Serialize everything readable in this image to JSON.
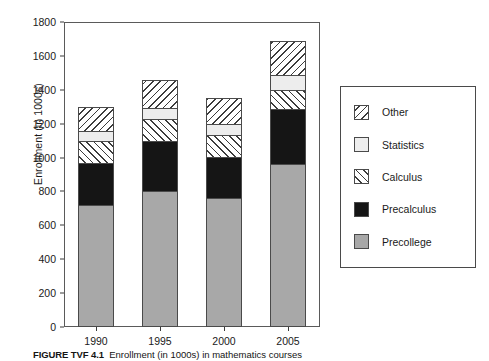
{
  "chart_data": {
    "type": "bar",
    "subtype": "stacked-bar",
    "title": "",
    "xlabel": "",
    "ylabel": "Enrollment (in 1000s)",
    "categories": [
      "1990",
      "1995",
      "2000",
      "2005"
    ],
    "ylim": [
      0,
      1800
    ],
    "yticks": [
      0,
      200,
      400,
      600,
      800,
      1000,
      1200,
      1400,
      1600,
      1800
    ],
    "ytick_labels": [
      "0",
      "200",
      "400",
      "600",
      "800",
      "1000",
      "1200",
      "1400",
      "1600",
      "1800"
    ],
    "grid": false,
    "legend_position": "right-outside",
    "stack_order_bottom_to_top": [
      "Precollege",
      "Precalculus",
      "Calculus",
      "Statistics",
      "Other"
    ],
    "series": [
      {
        "name": "Precollege",
        "fill": "solid-gray",
        "color": "#a8a8a8",
        "values": [
          720,
          800,
          760,
          960
        ]
      },
      {
        "name": "Precalculus",
        "fill": "solid-black",
        "color": "#151515",
        "values": [
          250,
          295,
          245,
          325
        ]
      },
      {
        "name": "Calculus",
        "fill": "hatch-forward-slash",
        "color": "#ffffff",
        "values": [
          130,
          130,
          130,
          115
        ]
      },
      {
        "name": "Statistics",
        "fill": "solid-light-gray",
        "color": "#ededed",
        "values": [
          55,
          65,
          65,
          90
        ]
      },
      {
        "name": "Other",
        "fill": "hatch-back-slash",
        "color": "#ffffff",
        "values": [
          145,
          170,
          150,
          200
        ]
      }
    ],
    "totals": [
      1300,
      1460,
      1350,
      1690
    ]
  },
  "legend": {
    "entries": [
      {
        "label": "Other",
        "swatch": "hatch-back-slash-swatch"
      },
      {
        "label": "Statistics",
        "swatch": "solid-light-gray-swatch"
      },
      {
        "label": "Calculus",
        "swatch": "hatch-forward-slash-swatch"
      },
      {
        "label": "Precalculus",
        "swatch": "solid-black-swatch"
      },
      {
        "label": "Precollege",
        "swatch": "solid-gray-swatch"
      }
    ]
  },
  "caption": {
    "figure_number": "FIGURE TVF 4.1",
    "text": "Enrollment (in 1000s) in mathematics courses"
  },
  "colors": {
    "precollege": "#a8a8a8",
    "precalculus": "#151515",
    "statistics": "#ededed",
    "hatch_line": "#3c3c3c",
    "axis": "#3a3a3a",
    "frame": "#5a5a5a",
    "text": "#1a1a1a",
    "background": "#ffffff"
  }
}
